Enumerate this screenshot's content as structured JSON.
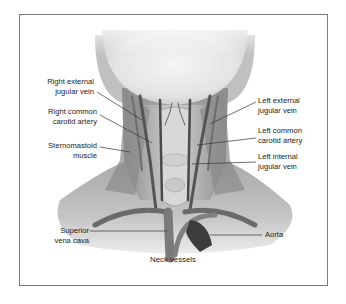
{
  "figure": {
    "caption": "Neck vessels",
    "labels": {
      "right_external_jugular_vein": [
        "Right external",
        "jugular vein"
      ],
      "right_common_carotid_artery": [
        "Right common",
        "carotid artery"
      ],
      "sternomastoid_muscle": [
        "Sternomastoid",
        "muscle"
      ],
      "left_external_jugular_vein": [
        "Left external",
        "jugular vein"
      ],
      "left_common_carotid_artery": [
        "Left common",
        "carotid artery"
      ],
      "left_internal_jugular_vein": [
        "Left internal",
        "jugular vein"
      ],
      "superior_vena_cava": [
        "Superior",
        "vena cava"
      ],
      "aorta": [
        "Aorta"
      ]
    },
    "colors": {
      "frame": "#7a7a7a",
      "skin_light": "#e6e6e6",
      "skin_mid": "#b9b9b9",
      "vessel_dark": "#444444",
      "vessel_mid": "#7d7d7d",
      "text": "#222222",
      "leader": "#333333"
    }
  }
}
